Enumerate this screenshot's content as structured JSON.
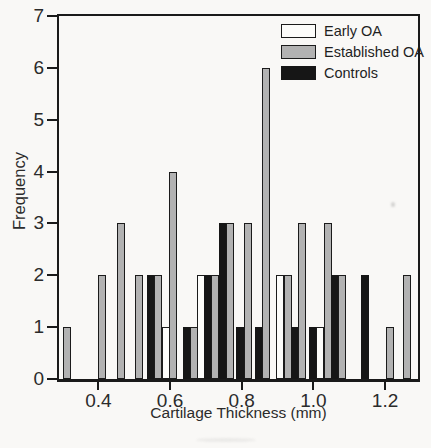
{
  "figure": {
    "background": "#f9f8f6",
    "axis_color": "#1a1a1a",
    "text_color": "#2b2b2b"
  },
  "chart_data": {
    "type": "bar",
    "title": "",
    "xlabel": "Cartilage Thickness (mm)",
    "ylabel": "Frequency",
    "xlim": [
      0.29,
      1.292
    ],
    "ylim": [
      0,
      7
    ],
    "grid": false,
    "legend_position": "top-right",
    "bar_width_mm": 0.0204,
    "yticks": [
      0,
      1,
      2,
      3,
      4,
      5,
      6,
      7
    ],
    "ytick_labels": [
      "0",
      "1",
      "2",
      "3",
      "4",
      "5",
      "6",
      "7"
    ],
    "xticks": [
      0.4,
      0.6,
      0.8,
      1.0,
      1.2
    ],
    "xtick_labels": [
      "0.4",
      "0.6",
      "0.8",
      "1.0",
      "1.2"
    ],
    "series": [
      {
        "name": "Early OA",
        "fill": "#fcfcfa",
        "border": "#1b1b1b",
        "points": [
          {
            "x": 0.588,
            "f": 1
          },
          {
            "x": 0.687,
            "f": 2
          },
          {
            "x": 0.908,
            "f": 2
          },
          {
            "x": 1.019,
            "f": 1
          }
        ]
      },
      {
        "name": "Established OA",
        "fill": "#b2b2b2",
        "border": "#1b1b1b",
        "points": [
          {
            "x": 0.313,
            "f": 1
          },
          {
            "x": 0.411,
            "f": 2
          },
          {
            "x": 0.463,
            "f": 3
          },
          {
            "x": 0.513,
            "f": 2
          },
          {
            "x": 0.567,
            "f": 2
          },
          {
            "x": 0.608,
            "f": 4
          },
          {
            "x": 0.667,
            "f": 1
          },
          {
            "x": 0.726,
            "f": 2
          },
          {
            "x": 0.767,
            "f": 3
          },
          {
            "x": 0.818,
            "f": 3
          },
          {
            "x": 0.869,
            "f": 6
          },
          {
            "x": 0.929,
            "f": 2
          },
          {
            "x": 0.969,
            "f": 3
          },
          {
            "x": 1.04,
            "f": 3
          },
          {
            "x": 1.081,
            "f": 2
          },
          {
            "x": 1.215,
            "f": 1
          },
          {
            "x": 1.261,
            "f": 2
          }
        ]
      },
      {
        "name": "Controls",
        "fill": "#161616",
        "border": "#161616",
        "points": [
          {
            "x": 0.547,
            "f": 2
          },
          {
            "x": 0.647,
            "f": 1
          },
          {
            "x": 0.707,
            "f": 2
          },
          {
            "x": 0.747,
            "f": 3
          },
          {
            "x": 0.796,
            "f": 1
          },
          {
            "x": 0.849,
            "f": 1
          },
          {
            "x": 0.949,
            "f": 1
          },
          {
            "x": 0.999,
            "f": 1
          },
          {
            "x": 1.06,
            "f": 2
          },
          {
            "x": 1.145,
            "f": 2
          }
        ]
      }
    ]
  }
}
